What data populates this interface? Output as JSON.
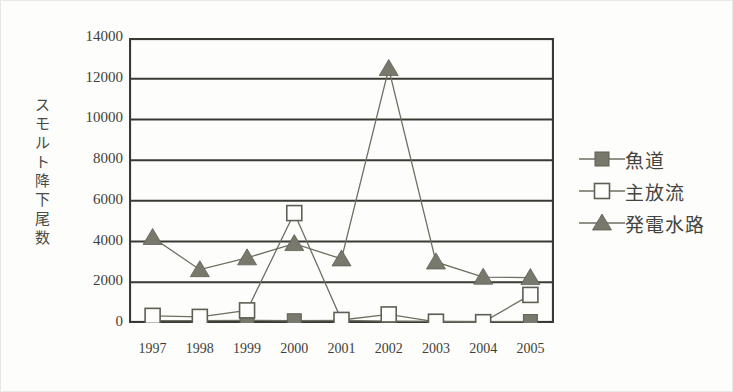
{
  "chart_data": {
    "type": "line",
    "title": "",
    "subtitle": "",
    "xlabel": "",
    "ylabel": "スモルト降下尾数",
    "categories": [
      "1997",
      "1998",
      "1999",
      "2000",
      "2001",
      "2002",
      "2003",
      "2004",
      "2005"
    ],
    "x": [
      1997,
      1998,
      1999,
      2000,
      2001,
      2002,
      2003,
      2004,
      2005
    ],
    "ylim": [
      0,
      14000
    ],
    "yticks": [
      0,
      2000,
      4000,
      6000,
      8000,
      10000,
      12000,
      14000
    ],
    "ytick_labels": [
      "0",
      "2000",
      "4000",
      "6000",
      "8000",
      "10000",
      "12000",
      "14000"
    ],
    "grid": "horizontal",
    "legend_position": "right",
    "series": [
      {
        "name": "魚道",
        "marker": "filled-square",
        "color": "#78786c",
        "values": [
          120,
          120,
          130,
          110,
          130,
          90,
          80,
          70,
          70
        ]
      },
      {
        "name": "主放流",
        "marker": "open-square",
        "color": "#78786c",
        "values": [
          350,
          300,
          620,
          5400,
          150,
          420,
          60,
          40,
          1380
        ]
      },
      {
        "name": "発電水路",
        "marker": "filled-triangle",
        "color": "#78786c",
        "values": [
          4200,
          2620,
          3200,
          3900,
          3150,
          12500,
          3000,
          2250,
          2230
        ]
      }
    ]
  },
  "legend": {
    "entries": [
      {
        "label": "魚道",
        "marker": "filled-square"
      },
      {
        "label": "主放流",
        "marker": "open-square"
      },
      {
        "label": "発電水路",
        "marker": "filled-triangle"
      }
    ]
  },
  "colors": {
    "marker": "#78786c",
    "line": "#6e6e62",
    "axis": "#3a3a34",
    "grid": "#3a3a34",
    "text": "#3f3f3a",
    "background": "#fdfdfb"
  }
}
